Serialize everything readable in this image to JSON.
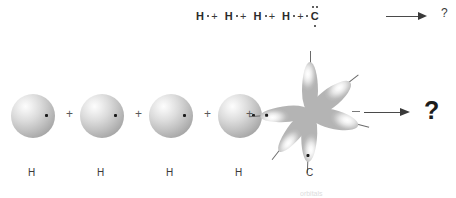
{
  "figure": {
    "bottom_partial_text": "orbitals"
  },
  "lewis_equation": {
    "terms": [
      {
        "symbol": "H",
        "dots": 1
      },
      {
        "symbol": "H",
        "dots": 1
      },
      {
        "symbol": "H",
        "dots": 1
      },
      {
        "symbol": "H",
        "dots": 1
      },
      {
        "symbol": "C",
        "dots": 4
      }
    ],
    "plus": "+",
    "arrow": "arrow-right",
    "product": "?"
  },
  "orbital_diagram": {
    "plus": "+",
    "arrow": "arrow-right",
    "product": "?",
    "atoms": [
      {
        "label": "H",
        "type": "s-orbital-sphere",
        "electrons": 1
      },
      {
        "label": "H",
        "type": "s-orbital-sphere",
        "electrons": 1
      },
      {
        "label": "H",
        "type": "s-orbital-sphere",
        "electrons": 1
      },
      {
        "label": "H",
        "type": "s-orbital-sphere",
        "electrons": 1
      },
      {
        "label": "C",
        "type": "hybrid-orbital-lobes",
        "lobes": 5,
        "electrons": 4
      }
    ],
    "carbon_lobes": [
      {
        "angle": 0,
        "dot": false,
        "stick": true,
        "wide": false
      },
      {
        "angle": 52,
        "dot": false,
        "stick": true,
        "wide": true
      },
      {
        "angle": 104,
        "dot": false,
        "stick": true,
        "wide": true
      },
      {
        "angle": 178,
        "dot": true,
        "stick": true,
        "wide": false
      },
      {
        "angle": 230,
        "dot": false,
        "stick": true,
        "wide": false
      },
      {
        "angle": 282,
        "dot": true,
        "stick": true,
        "wide": false
      }
    ]
  },
  "colors": {
    "sphere_light": "#fdfdfd",
    "sphere_dark": "#949494",
    "electron_dot": "#1a1a1a",
    "arrow": "#3a3a3a",
    "text": "#2b2b2b"
  }
}
